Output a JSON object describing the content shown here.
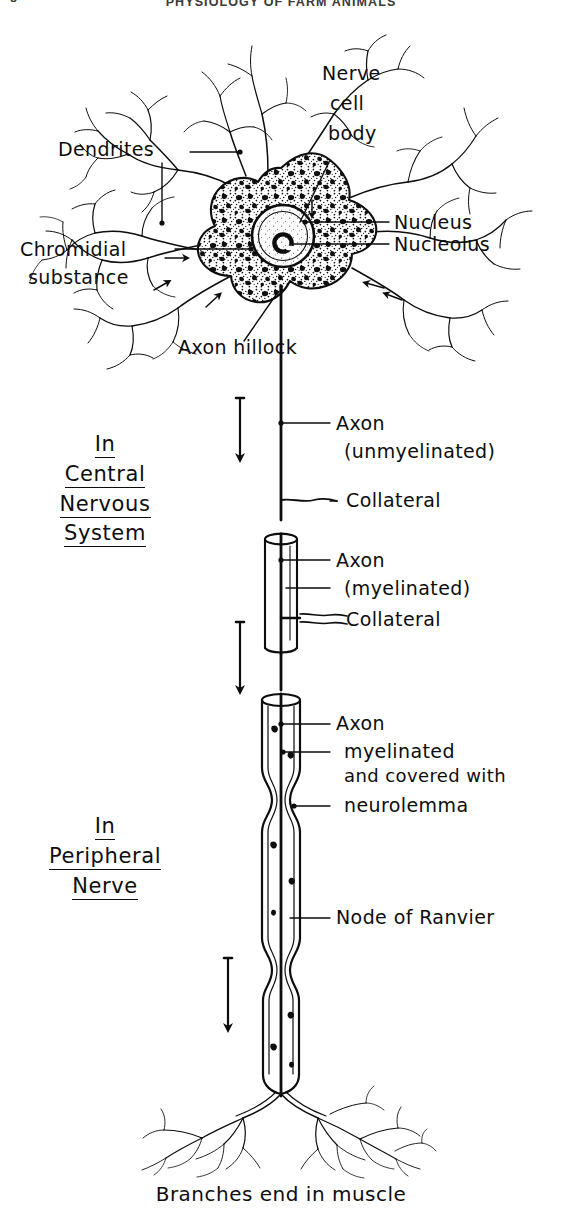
{
  "page": {
    "width": 562,
    "height": 1226,
    "background": "#ffffff",
    "ink_color": "#0d0d0d"
  },
  "running_head": {
    "folio": "8",
    "title": "PHYSIOLOGY OF FARM ANIMALS"
  },
  "figure": {
    "caption": "Branches end in muscle",
    "sections": [
      {
        "id": "central-nervous-system",
        "words": [
          "In",
          "Central",
          "Nervous",
          "System"
        ],
        "underlined": true
      },
      {
        "id": "peripheral-nerve",
        "words": [
          "In",
          "Peripheral",
          "Nerve"
        ],
        "underlined": true
      }
    ],
    "labels": [
      {
        "id": "dendrites",
        "text": "Dendrites"
      },
      {
        "id": "nerve-cell-body",
        "lines": [
          "Nerve",
          "cell",
          "body"
        ]
      },
      {
        "id": "nucleus",
        "text": "Nucleus"
      },
      {
        "id": "nucleolus",
        "text": "Nucleolus"
      },
      {
        "id": "chromidial",
        "lines": [
          "Chromidial",
          "substance"
        ]
      },
      {
        "id": "axon-hillock",
        "text": "Axon  hillock"
      },
      {
        "id": "axon-unmyelinated",
        "lines": [
          "Axon",
          "(unmyelinated)"
        ]
      },
      {
        "id": "collateral-upper",
        "text": "Collateral"
      },
      {
        "id": "axon-myelinated",
        "lines": [
          "Axon",
          "(myelinated)"
        ]
      },
      {
        "id": "collateral-lower",
        "text": "Collateral"
      },
      {
        "id": "axon-neurolemma",
        "lines": [
          "Axon",
          "myelinated",
          "and covered with",
          "neurolemma"
        ]
      },
      {
        "id": "node-of-ranvier",
        "text": "Node of Ranvier"
      }
    ]
  }
}
